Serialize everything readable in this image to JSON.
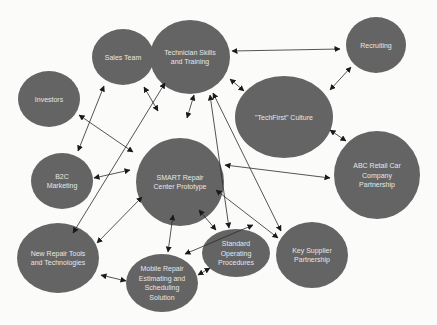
{
  "diagram": {
    "type": "network",
    "colors": {
      "node_fill": "#646464",
      "node_text": "#e6e6e6",
      "edge": "#2a2a2a",
      "background": "#fbfbfa"
    },
    "nodes": [
      {
        "id": "sales",
        "lines": [
          "Sales Team"
        ],
        "cx": 123,
        "cy": 57,
        "rx": 31,
        "ry": 28
      },
      {
        "id": "tech",
        "lines": [
          "Technician Skills",
          "and Training"
        ],
        "cx": 190,
        "cy": 57,
        "rx": 40,
        "ry": 37
      },
      {
        "id": "recruiting",
        "lines": [
          "Recruiting"
        ],
        "cx": 376,
        "cy": 45,
        "rx": 30,
        "ry": 28
      },
      {
        "id": "investors",
        "lines": [
          "Investors"
        ],
        "cx": 49,
        "cy": 99,
        "rx": 31,
        "ry": 28
      },
      {
        "id": "techfirst",
        "lines": [
          "\"TechFirst\" Culture"
        ],
        "cx": 284,
        "cy": 117,
        "rx": 49,
        "ry": 41
      },
      {
        "id": "smart",
        "lines": [
          "SMART Repair",
          "Center Prototype"
        ],
        "cx": 180,
        "cy": 182,
        "rx": 44,
        "ry": 44
      },
      {
        "id": "b2c",
        "lines": [
          "B2C",
          "Marketing"
        ],
        "cx": 62,
        "cy": 181,
        "rx": 31,
        "ry": 28
      },
      {
        "id": "abc",
        "lines": [
          "ABC Retail Car",
          "Company",
          "Partnership"
        ],
        "cx": 377,
        "cy": 175,
        "rx": 43,
        "ry": 44
      },
      {
        "id": "newtools",
        "lines": [
          "New Repair Tools",
          "and Technologies"
        ],
        "cx": 58,
        "cy": 258,
        "rx": 41,
        "ry": 35
      },
      {
        "id": "sop",
        "lines": [
          "Standard",
          "Operating",
          "Procedures"
        ],
        "cx": 236,
        "cy": 253,
        "rx": 34,
        "ry": 24
      },
      {
        "id": "supplier",
        "lines": [
          "Key Supplier",
          "Partnership"
        ],
        "cx": 312,
        "cy": 255,
        "rx": 36,
        "ry": 33
      },
      {
        "id": "mobile",
        "lines": [
          "Mobile Repair",
          "Estimating and",
          "Scheduling",
          "Solution"
        ],
        "cx": 162,
        "cy": 283,
        "rx": 36,
        "ry": 29
      }
    ],
    "edges": [
      {
        "from": "tech",
        "to": "recruiting",
        "x1": 232,
        "y1": 51,
        "x2": 340,
        "y2": 49
      },
      {
        "from": "recruiting",
        "to": "techfirst",
        "x1": 351,
        "y1": 67,
        "x2": 330,
        "y2": 90
      },
      {
        "from": "tech",
        "to": "techfirst",
        "x1": 230,
        "y1": 79,
        "x2": 244,
        "y2": 91
      },
      {
        "from": "techfirst",
        "to": "abc",
        "x1": 330,
        "y1": 130,
        "x2": 346,
        "y2": 141
      },
      {
        "from": "sales",
        "to": "b2c",
        "x1": 104,
        "y1": 86,
        "x2": 78,
        "y2": 151
      },
      {
        "from": "sales",
        "to": "smart",
        "x1": 144,
        "y1": 87,
        "x2": 158,
        "y2": 111
      },
      {
        "from": "investors",
        "to": "smart",
        "x1": 79,
        "y1": 115,
        "x2": 133,
        "y2": 152
      },
      {
        "from": "tech",
        "to": "smart",
        "x1": 194,
        "y1": 95,
        "x2": 187,
        "y2": 118
      },
      {
        "from": "tech",
        "to": "newtools",
        "x1": 165,
        "y1": 83,
        "x2": 73,
        "y2": 233
      },
      {
        "from": "b2c",
        "to": "smart",
        "x1": 94,
        "y1": 178,
        "x2": 130,
        "y2": 170
      },
      {
        "from": "smart",
        "to": "abc",
        "x1": 225,
        "y1": 165,
        "x2": 330,
        "y2": 178
      },
      {
        "from": "smart",
        "to": "newtools",
        "x1": 97,
        "y1": 243,
        "x2": 142,
        "y2": 197
      },
      {
        "from": "smart",
        "to": "mobile",
        "x1": 173,
        "y1": 215,
        "x2": 168,
        "y2": 252
      },
      {
        "from": "smart",
        "to": "sop",
        "x1": 199,
        "y1": 210,
        "x2": 216,
        "y2": 230
      },
      {
        "from": "smart",
        "to": "supplier",
        "x1": 216,
        "y1": 190,
        "x2": 278,
        "y2": 238
      },
      {
        "from": "tech",
        "to": "sop",
        "x1": 210,
        "y1": 95,
        "x2": 229,
        "y2": 228
      },
      {
        "from": "tech",
        "to": "supplier",
        "x1": 213,
        "y1": 93,
        "x2": 281,
        "y2": 231
      },
      {
        "from": "techfirst",
        "to": "mobile",
        "x1": 253,
        "y1": 225,
        "x2": 185,
        "y2": 254
      },
      {
        "from": "newtools",
        "to": "mobile",
        "x1": 101,
        "y1": 275,
        "x2": 126,
        "y2": 281
      },
      {
        "from": "mobile",
        "to": "sop",
        "x1": 198,
        "y1": 275,
        "x2": 210,
        "y2": 268
      }
    ]
  }
}
